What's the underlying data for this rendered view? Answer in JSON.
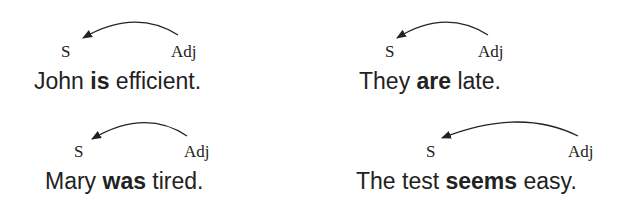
{
  "examples": [
    {
      "subject_label": "S",
      "complement_label": "Adj",
      "pre": "John ",
      "verb": "is",
      "post": " efficient."
    },
    {
      "subject_label": "S",
      "complement_label": "Adj",
      "pre": "They ",
      "verb": "are",
      "post": " late."
    },
    {
      "subject_label": "S",
      "complement_label": "Adj",
      "pre": "Mary ",
      "verb": "was",
      "post": " tired."
    },
    {
      "subject_label": "S",
      "complement_label": "Adj",
      "pre": "The test ",
      "verb": "seems",
      "post": " easy."
    }
  ],
  "colors": {
    "ink": "#222222",
    "background": "#ffffff"
  }
}
